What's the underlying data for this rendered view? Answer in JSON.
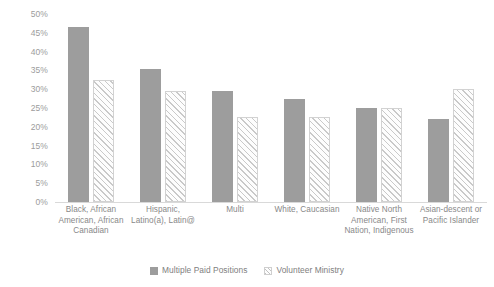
{
  "chart_data": {
    "type": "bar",
    "title": "",
    "subtitle": "",
    "xlabel": "",
    "ylabel": "",
    "ylim": [
      0,
      50
    ],
    "ytick_labels": [
      "50%",
      "45%",
      "40%",
      "35%",
      "30%",
      "25%",
      "20%",
      "15%",
      "10%",
      "5%",
      "0%"
    ],
    "ytick_values": [
      50,
      45,
      40,
      35,
      30,
      25,
      20,
      15,
      10,
      5,
      0
    ],
    "grid": false,
    "legend_position": "bottom",
    "value_format": "percent",
    "categories": [
      "Black, African American, African Canadian",
      "Hispanic, Latino(a), Latin@",
      "Multi",
      "White, Caucasian",
      "Native North American, First Nation, Indigenous",
      "Asian-descent or Pacific Islander"
    ],
    "series": [
      {
        "name": "Multiple Paid Positions",
        "style": "solid",
        "color": "#9d9d9d",
        "values": [
          46.5,
          35.5,
          29.5,
          27.5,
          25.0,
          22.0
        ]
      },
      {
        "name": "Volunteer Ministry",
        "style": "hatched",
        "color": "#ffffff",
        "values": [
          32.5,
          29.5,
          22.5,
          22.5,
          25.0,
          30.0
        ]
      }
    ]
  },
  "legend": {
    "items": [
      {
        "label": "Multiple Paid Positions",
        "swatch": "solid-square-icon"
      },
      {
        "label": "Volunteer Ministry",
        "swatch": "hatched-square-icon"
      }
    ]
  }
}
